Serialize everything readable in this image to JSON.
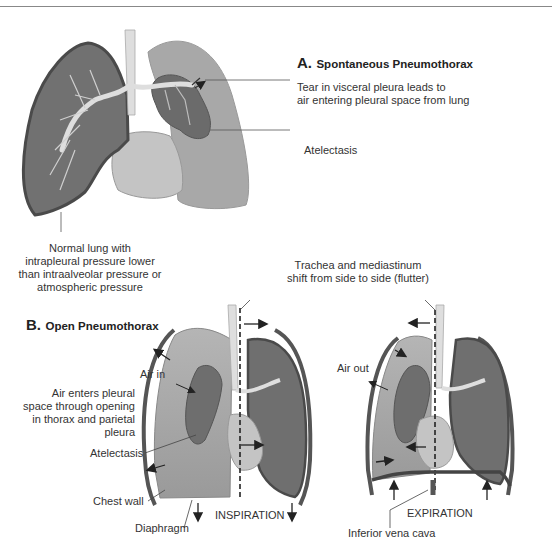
{
  "panel_a": {
    "letter": "A.",
    "title": "Spontaneous Pneumothorax",
    "labels": {
      "tear_line1": "Tear in visceral pleura leads to",
      "tear_line2": "air entering pleural space from lung",
      "atelectasis": "Atelectasis",
      "normal_line1": "Normal lung with",
      "normal_line2": "intrapleural pressure lower",
      "normal_line3": "than intraalveolar pressure or",
      "normal_line4": "atmospheric pressure"
    }
  },
  "panel_b": {
    "letter": "B.",
    "title": "Open Pneumothorax",
    "labels": {
      "shift_line1": "Trachea and mediastinum",
      "shift_line2": "shift from side to side (flutter)",
      "air_in": "Air in",
      "entry_line1": "Air enters pleural",
      "entry_line2": "space through opening",
      "entry_line3": "in thorax and parietal",
      "entry_line4": "pleura",
      "atelectasis": "Atelectasis",
      "chest_wall": "Chest wall",
      "diaphragm": "Diaphragm",
      "inspiration": "INSPIRATION",
      "air_out": "Air out",
      "expiration": "EXPIRATION",
      "ivc": "Inferior vena cava"
    }
  },
  "colors": {
    "collapsed_lung": "#6b6b6b",
    "normal_lung": "#717171",
    "pleural_space": "#a9a9a9",
    "airway": "#dedede",
    "heart": "#c4c4c4"
  }
}
